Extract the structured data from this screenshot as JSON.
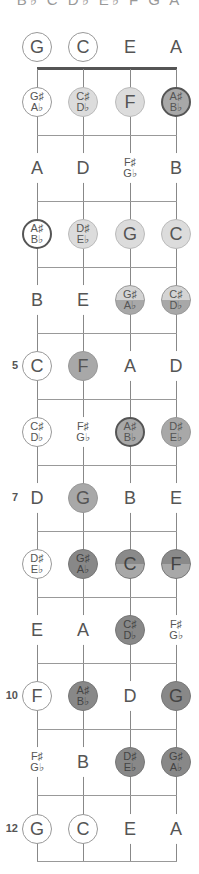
{
  "title": "B♭ C D♭ E♭ F G A",
  "strings": [
    "G",
    "C",
    "E",
    "A"
  ],
  "string_x": [
    37,
    83,
    130,
    176
  ],
  "row_y": [
    47,
    102,
    168,
    234,
    300,
    366,
    432,
    498,
    564,
    630,
    696,
    762,
    829
  ],
  "fret_line_y": [
    135,
    201,
    267,
    333,
    399,
    465,
    531,
    597,
    663,
    729,
    795,
    861
  ],
  "fret_numbers": [
    {
      "fret": 5,
      "label": "5"
    },
    {
      "fret": 7,
      "label": "7"
    },
    {
      "fret": 10,
      "label": "10"
    },
    {
      "fret": 12,
      "label": "12"
    }
  ],
  "colors": {
    "light": "#dcdcdc",
    "mid": "#a8a8a8",
    "dark": "#888888",
    "line": "#999999",
    "nut": "#555555"
  },
  "frets": [
    {
      "fret": 0,
      "notes": [
        {
          "top": "G",
          "style": "outline"
        },
        {
          "top": "C",
          "style": "outline"
        },
        {
          "top": "E",
          "style": "plain"
        },
        {
          "top": "A",
          "style": "plain"
        }
      ]
    },
    {
      "fret": 1,
      "notes": [
        {
          "top": "G♯",
          "bottom": "A♭",
          "style": "outline"
        },
        {
          "top": "C♯",
          "bottom": "D♭",
          "style": "light"
        },
        {
          "top": "F",
          "style": "light"
        },
        {
          "top": "A♯",
          "bottom": "B♭",
          "style": "mid heavy"
        }
      ]
    },
    {
      "fret": 2,
      "notes": [
        {
          "top": "A",
          "style": "plain"
        },
        {
          "top": "D",
          "style": "plain"
        },
        {
          "top": "F♯",
          "bottom": "G♭",
          "style": "plain"
        },
        {
          "top": "B",
          "style": "plain"
        }
      ]
    },
    {
      "fret": 3,
      "notes": [
        {
          "top": "A♯",
          "bottom": "B♭",
          "style": "outline heavy"
        },
        {
          "top": "D♯",
          "bottom": "E♭",
          "style": "light"
        },
        {
          "top": "G",
          "style": "light"
        },
        {
          "top": "C",
          "style": "light"
        }
      ]
    },
    {
      "fret": 4,
      "notes": [
        {
          "top": "B",
          "style": "plain"
        },
        {
          "top": "E",
          "style": "plain"
        },
        {
          "top": "G♯",
          "bottom": "A♭",
          "style": "split-lm"
        },
        {
          "top": "C♯",
          "bottom": "D♭",
          "style": "split-lm"
        }
      ]
    },
    {
      "fret": 5,
      "notes": [
        {
          "top": "C",
          "style": "outline"
        },
        {
          "top": "F",
          "style": "mid"
        },
        {
          "top": "A",
          "style": "plain"
        },
        {
          "top": "D",
          "style": "plain"
        }
      ]
    },
    {
      "fret": 6,
      "notes": [
        {
          "top": "C♯",
          "bottom": "D♭",
          "style": "outline"
        },
        {
          "top": "F♯",
          "bottom": "G♭",
          "style": "plain"
        },
        {
          "top": "A♯",
          "bottom": "B♭",
          "style": "mid heavy"
        },
        {
          "top": "D♯",
          "bottom": "E♭",
          "style": "mid"
        }
      ]
    },
    {
      "fret": 7,
      "notes": [
        {
          "top": "D",
          "style": "plain"
        },
        {
          "top": "G",
          "style": "mid"
        },
        {
          "top": "B",
          "style": "plain"
        },
        {
          "top": "E",
          "style": "plain"
        }
      ]
    },
    {
      "fret": 8,
      "notes": [
        {
          "top": "D♯",
          "bottom": "E♭",
          "style": "outline"
        },
        {
          "top": "G♯",
          "bottom": "A♭",
          "style": "dark"
        },
        {
          "top": "C",
          "style": "split-dm"
        },
        {
          "top": "F",
          "style": "split-dm"
        }
      ]
    },
    {
      "fret": 9,
      "notes": [
        {
          "top": "E",
          "style": "plain"
        },
        {
          "top": "A",
          "style": "plain"
        },
        {
          "top": "C♯",
          "bottom": "D♭",
          "style": "dark"
        },
        {
          "top": "F♯",
          "bottom": "G♭",
          "style": "plain"
        }
      ]
    },
    {
      "fret": 10,
      "notes": [
        {
          "top": "F",
          "style": "outline"
        },
        {
          "top": "A♯",
          "bottom": "B♭",
          "style": "dark"
        },
        {
          "top": "D",
          "style": "plain"
        },
        {
          "top": "G",
          "style": "dark"
        }
      ]
    },
    {
      "fret": 11,
      "notes": [
        {
          "top": "F♯",
          "bottom": "G♭",
          "style": "plain"
        },
        {
          "top": "B",
          "style": "plain"
        },
        {
          "top": "D♯",
          "bottom": "E♭",
          "style": "dark"
        },
        {
          "top": "G♯",
          "bottom": "A♭",
          "style": "dark"
        }
      ]
    },
    {
      "fret": 12,
      "notes": [
        {
          "top": "G",
          "style": "outline"
        },
        {
          "top": "C",
          "style": "outline"
        },
        {
          "top": "E",
          "style": "plain"
        },
        {
          "top": "A",
          "style": "plain"
        }
      ]
    }
  ]
}
